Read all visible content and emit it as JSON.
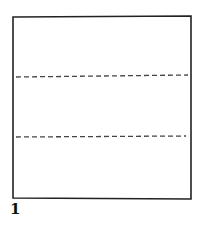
{
  "diagram": {
    "type": "folding-instruction",
    "step_label": "1",
    "square": {
      "x": 13,
      "y": 16,
      "width": 178,
      "height": 183,
      "stroke": "#222222"
    },
    "fold_lines": [
      {
        "name": "upper-fold-line",
        "y1": 77,
        "y2": 75,
        "style": "dashed"
      },
      {
        "name": "lower-fold-line",
        "y1": 137,
        "y2": 136,
        "style": "dashed"
      }
    ]
  }
}
